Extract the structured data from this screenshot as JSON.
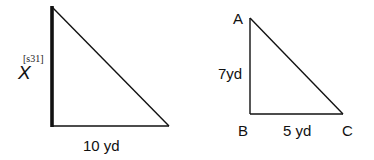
{
  "figure_left": {
    "unknown_label": "X",
    "tag_label": "[s31]",
    "base_label": "10 yd",
    "points": {
      "top": [
        52,
        7
      ],
      "corner": [
        52,
        126
      ],
      "right": [
        169,
        126
      ]
    },
    "highlighted_side": "vertical"
  },
  "figure_right": {
    "vertices": {
      "A": "A",
      "B": "B",
      "C": "C"
    },
    "side_AB_label": "7yd",
    "side_BC_label": "5 yd",
    "points": {
      "A": [
        250,
        18
      ],
      "B": [
        250,
        114
      ],
      "C": [
        343,
        114
      ]
    }
  },
  "colors": {
    "stroke": "#111111",
    "background": "#ffffff"
  }
}
